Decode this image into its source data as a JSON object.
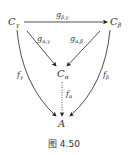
{
  "diagram": {
    "nodes": {
      "c_gamma": {
        "label": "C",
        "sub": "γ"
      },
      "c_beta": {
        "label": "C",
        "sub": "β"
      },
      "c_alpha": {
        "label": "C",
        "sub": "α"
      },
      "a": {
        "label": "A"
      }
    },
    "arrows": {
      "g_beta_gamma": {
        "label": "g",
        "sub": "β,γ"
      },
      "g_alpha_gamma": {
        "label": "g",
        "sub": "α,γ"
      },
      "g_alpha_beta": {
        "label": "g",
        "sub": "α,β"
      },
      "f_gamma": {
        "label": "f",
        "sub": "γ"
      },
      "f_beta": {
        "label": "f",
        "sub": "β"
      },
      "f_alpha": {
        "label": "f",
        "sub": "α",
        "style": "dotted"
      }
    },
    "caption": "图 4.50"
  }
}
